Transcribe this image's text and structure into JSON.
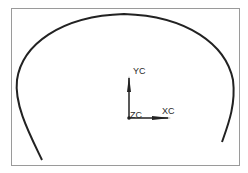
{
  "canvas": {
    "background": "#ffffff",
    "frame_color": "#9a9a9a",
    "curve_color": "#222222"
  },
  "triad": {
    "x_label": "XC",
    "y_label": "YC",
    "z_label": "ZC"
  }
}
